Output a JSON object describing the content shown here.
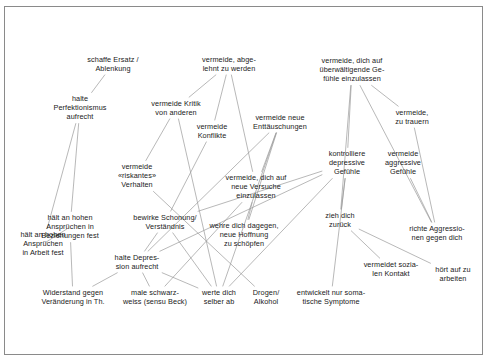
{
  "diagram": {
    "language": "de",
    "background": "#ffffff",
    "border_color": "#8a8a8a",
    "edge_color": "#9a9a9a",
    "text_color": "#1a1a1a",
    "nodes": [
      {
        "id": "n1",
        "label": "schaffe Ersatz /\nAblenkung",
        "x": 113,
        "y": 64
      },
      {
        "id": "n2",
        "label": "vermeide, abge-\nlehnt zu werden",
        "x": 229,
        "y": 64
      },
      {
        "id": "n3",
        "label": "vermeide, dich auf\nüberwältigende Ge-\nfühle einzulassen",
        "x": 352,
        "y": 70
      },
      {
        "id": "n4",
        "label": "halte\nPerfektionismus\naufrecht",
        "x": 80,
        "y": 108
      },
      {
        "id": "n5",
        "label": "vermeide Kritik\nvon anderen",
        "x": 176,
        "y": 108
      },
      {
        "id": "n6",
        "label": "vermeide\nKonflikte",
        "x": 212,
        "y": 131
      },
      {
        "id": "n7",
        "label": "vermeide neue\nEnttäuschungen",
        "x": 280,
        "y": 122
      },
      {
        "id": "n8",
        "label": "vermeide,\nzu trauern",
        "x": 412,
        "y": 117
      },
      {
        "id": "n9",
        "label": "kontrolliere\ndepressive\nGefühle",
        "x": 347,
        "y": 163
      },
      {
        "id": "n10",
        "label": "vermeide\naggressive\nGefühle",
        "x": 403,
        "y": 163
      },
      {
        "id": "n11",
        "label": "vermeide\n«riskantes»\nVerhalten",
        "x": 137,
        "y": 176
      },
      {
        "id": "n12",
        "label": "vermeide, dich auf\nneue Versuche\neinzulassen",
        "x": 256,
        "y": 187
      },
      {
        "id": "n13",
        "label": "hält an hohen\nAnsprüchen in\nBeziehungen fest",
        "x": 70,
        "y": 227
      },
      {
        "id": "n14",
        "label": "bewirke Schonung/\nVerständnis",
        "x": 165,
        "y": 222
      },
      {
        "id": "n15",
        "label": "wehre dich dagegen,\nneue Hoffnung\nzu schöpfen",
        "x": 244,
        "y": 235
      },
      {
        "id": "n16",
        "label": "zieh dich\nzurück",
        "x": 340,
        "y": 220
      },
      {
        "id": "n17",
        "label": "hält an hohen\nAnsprüchen\nin Arbeit fest",
        "x": 43,
        "y": 244
      },
      {
        "id": "n18",
        "label": "richte Aggressio-\nnen gegen dich",
        "x": 437,
        "y": 233
      },
      {
        "id": "n19",
        "label": "halte Depres-\nsion aufrecht",
        "x": 137,
        "y": 262
      },
      {
        "id": "n20",
        "label": "vermeidet sozia-\nlen Kontakt",
        "x": 391,
        "y": 269
      },
      {
        "id": "n21",
        "label": "hört auf zu\narbeiten",
        "x": 453,
        "y": 274
      },
      {
        "id": "n22",
        "label": "Widerstand gegen\nVeränderung in Th.",
        "x": 73,
        "y": 297
      },
      {
        "id": "n23",
        "label": "male schwarz-\nweiss (sensu Beck)",
        "x": 155,
        "y": 297
      },
      {
        "id": "n24",
        "label": "werte dich\nselber ab",
        "x": 219,
        "y": 297
      },
      {
        "id": "n25",
        "label": "Drogen/\nAlkohol",
        "x": 266,
        "y": 297
      },
      {
        "id": "n26",
        "label": "entwickelt nur soma-\ntische Symptome",
        "x": 331,
        "y": 297
      }
    ],
    "edges": [
      {
        "from": "n1",
        "to": "n4"
      },
      {
        "from": "n4",
        "to": "n13"
      },
      {
        "from": "n4",
        "to": "n17"
      },
      {
        "from": "n2",
        "to": "n5"
      },
      {
        "from": "n2",
        "to": "n6"
      },
      {
        "from": "n2",
        "to": "n12"
      },
      {
        "from": "n5",
        "to": "n11"
      },
      {
        "from": "n5",
        "to": "n24"
      },
      {
        "from": "n6",
        "to": "n14"
      },
      {
        "from": "n7",
        "to": "n12"
      },
      {
        "from": "n7",
        "to": "n15"
      },
      {
        "from": "n7",
        "to": "n24"
      },
      {
        "from": "n7",
        "to": "n19"
      },
      {
        "from": "n3",
        "to": "n9"
      },
      {
        "from": "n3",
        "to": "n8"
      },
      {
        "from": "n3",
        "to": "n16"
      },
      {
        "from": "n3",
        "to": "n18"
      },
      {
        "from": "n8",
        "to": "n18"
      },
      {
        "from": "n10",
        "to": "n18"
      },
      {
        "from": "n9",
        "to": "n16"
      },
      {
        "from": "n9",
        "to": "n26"
      },
      {
        "from": "n9",
        "to": "n24"
      },
      {
        "from": "n9",
        "to": "n14"
      },
      {
        "from": "n9",
        "to": "n19"
      },
      {
        "from": "n11",
        "to": "n25"
      },
      {
        "from": "n12",
        "to": "n15"
      },
      {
        "from": "n12",
        "to": "n23"
      },
      {
        "from": "n14",
        "to": "n19"
      },
      {
        "from": "n14",
        "to": "n24"
      },
      {
        "from": "n19",
        "to": "n22"
      },
      {
        "from": "n19",
        "to": "n23"
      },
      {
        "from": "n19",
        "to": "n24"
      },
      {
        "from": "n16",
        "to": "n20"
      },
      {
        "from": "n16",
        "to": "n21"
      },
      {
        "from": "n13",
        "to": "n22"
      },
      {
        "from": "n17",
        "to": "n13"
      }
    ]
  }
}
